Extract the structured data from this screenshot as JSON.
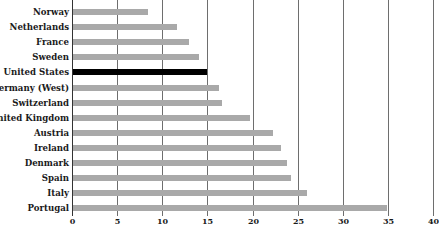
{
  "chart_data": {
    "type": "bar",
    "orientation": "horizontal",
    "title": "",
    "xlabel": "",
    "ylabel": "",
    "categories": [
      "Norway",
      "Netherlands",
      "France",
      "Sweden",
      "United States",
      "Germany (West)",
      "Switzerland",
      "United Kingdom",
      "Austria",
      "Ireland",
      "Denmark",
      "Spain",
      "Italy",
      "Portugal"
    ],
    "values": [
      8.3,
      11.5,
      12.9,
      14.0,
      14.8,
      16.2,
      16.5,
      19.6,
      22.2,
      23.1,
      23.7,
      24.2,
      25.9,
      34.8
    ],
    "highlight": "United States",
    "xlim": [
      0,
      40
    ],
    "xticks": [
      0,
      5,
      10,
      15,
      20,
      25,
      30,
      35,
      40
    ],
    "grid": "vertical",
    "legend": null,
    "colors": {
      "bar": "#a9a9a9",
      "highlight": "#000000",
      "grid": "#6e6e6e"
    }
  }
}
